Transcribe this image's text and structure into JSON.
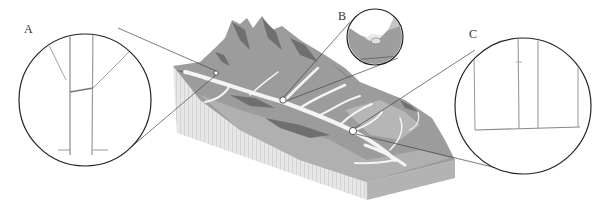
{
  "diagram": {
    "labels": {
      "a": "A",
      "b": "B",
      "c": "C"
    },
    "colors": {
      "background": "#ffffff",
      "terrain_mid": "#9a9a9a",
      "terrain_dark": "#6e6e6e",
      "terrain_light": "#b8b8b8",
      "river": "#f2f2f2",
      "block_side_left": "#e3e3e3",
      "block_side_right": "#b5b5b5",
      "outline": "#222222",
      "detail_line": "#8a8a8a"
    },
    "callouts": [
      {
        "id": "A",
        "marker": [
          216,
          73
        ],
        "circle_center": [
          85,
          100
        ],
        "circle_radius": 66
      },
      {
        "id": "B",
        "marker": [
          283,
          100
        ],
        "circle_center": [
          375,
          37
        ],
        "circle_radius": 28
      },
      {
        "id": "C",
        "marker": [
          353,
          131
        ],
        "circle_center": [
          523,
          106
        ],
        "circle_radius": 68
      }
    ]
  }
}
